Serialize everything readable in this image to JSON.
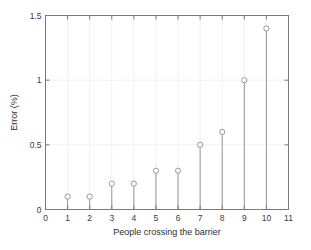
{
  "chart_data": {
    "type": "scatter",
    "plot_style": "stem",
    "title": "",
    "xlabel": "People crossing the barrier",
    "ylabel": "Error (%)",
    "x": [
      1,
      2,
      3,
      4,
      5,
      6,
      7,
      8,
      9,
      10
    ],
    "values": [
      0.1,
      0.1,
      0.2,
      0.2,
      0.3,
      0.3,
      0.5,
      0.6,
      1.0,
      1.4
    ],
    "xlim": [
      0,
      11
    ],
    "ylim": [
      0,
      1.5
    ],
    "xticks": [
      0,
      1,
      2,
      3,
      4,
      5,
      6,
      7,
      8,
      9,
      10,
      11
    ],
    "xticklabels": [
      "0",
      "1",
      "2",
      "3",
      "4",
      "5",
      "6",
      "7",
      "8",
      "9",
      "10",
      "11"
    ],
    "yticks": [
      0,
      0.5,
      1,
      1.5
    ],
    "yticklabels": [
      "0",
      "0.5",
      "1",
      "1.5"
    ],
    "grid": true,
    "legend": null,
    "marker": "open-circle",
    "marker_color": "#8c8c8c",
    "stem_color": "#8c8c8c",
    "axis_color": "#7a7a7a",
    "grid_color": "#f0f0f0",
    "background_color": "#ffffff"
  }
}
